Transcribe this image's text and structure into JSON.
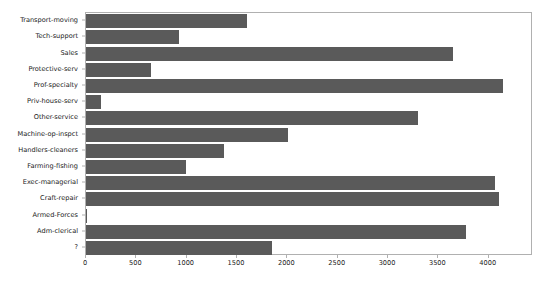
{
  "chart_data": {
    "type": "bar",
    "orientation": "horizontal",
    "title": "",
    "xlabel": "",
    "ylabel": "",
    "grid": false,
    "legend": false,
    "bar_color": "#5a5a5a",
    "axis_color": "#b0b0b0",
    "background": "#ffffff",
    "xlim": [
      0,
      4440
    ],
    "xticks": [
      0,
      500,
      1000,
      1500,
      2000,
      2500,
      3000,
      3500,
      4000
    ],
    "xticklabels": [
      "0",
      "500",
      "1000",
      "1500",
      "2000",
      "2500",
      "3000",
      "3500",
      "4000"
    ],
    "categories": [
      "Transport-moving",
      "Tech-support",
      "Sales",
      "Protective-serv",
      "Prof-specialty",
      "Priv-house-serv",
      "Other-service",
      "Machine-op-inspct",
      "Handlers-cleaners",
      "Farming-fishing",
      "Exec-managerial",
      "Craft-repair",
      "Armed-Forces",
      "Adm-clerical",
      "?"
    ],
    "values": [
      1597,
      928,
      3650,
      649,
      4140,
      149,
      3295,
      2002,
      1370,
      994,
      4066,
      4099,
      9,
      3770,
      1843
    ]
  }
}
